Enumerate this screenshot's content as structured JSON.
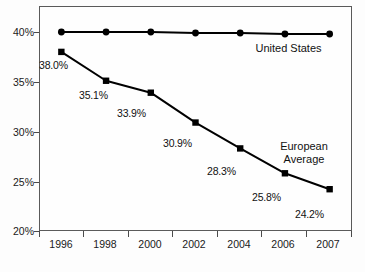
{
  "chart_data": {
    "type": "line",
    "title": "",
    "subtitle": "",
    "xlabel": "",
    "ylabel": "",
    "categories": [
      "1996",
      "1998",
      "2000",
      "2002",
      "2004",
      "2006",
      "2007"
    ],
    "ylim": [
      20,
      40
    ],
    "ytick_labels": [
      "20%",
      "25%",
      "30%",
      "35%",
      "40%"
    ],
    "ytick_values": [
      20,
      25,
      30,
      35,
      40
    ],
    "grid": false,
    "legend_position": "inline-annotation",
    "series": [
      {
        "name": "United States",
        "marker": "circle",
        "color": "#000000",
        "values": [
          40.0,
          40.0,
          40.0,
          39.9,
          39.9,
          39.8,
          39.8
        ],
        "data_labels": []
      },
      {
        "name": "European Average",
        "marker": "square",
        "color": "#000000",
        "values": [
          38.0,
          35.1,
          33.9,
          30.9,
          28.3,
          25.8,
          24.2
        ],
        "data_labels": [
          "38.0%",
          "35.1%",
          "33.9%",
          "30.9%",
          "28.3%",
          "25.8%",
          "24.2%"
        ]
      }
    ],
    "annotations": [
      {
        "text": "United States",
        "series": "United States"
      },
      {
        "text_line1": "European",
        "text_line2": "Average",
        "series": "European Average"
      }
    ]
  },
  "axis": {
    "y_labels": [
      "40%",
      "35%",
      "30%",
      "25%",
      "20%"
    ],
    "x_labels": [
      "1996",
      "1998",
      "2000",
      "2002",
      "2004",
      "2006",
      "2007"
    ]
  },
  "labels": {
    "us_annotation": "United States",
    "eu_annotation_line1": "European",
    "eu_annotation_line2": "Average",
    "eu_values": [
      "38.0%",
      "35.1%",
      "33.9%",
      "30.9%",
      "28.3%",
      "25.8%",
      "24.2%"
    ]
  },
  "colors": {
    "line": "#000000",
    "frame": "#5a5a5a",
    "background": "#fdfdfd",
    "text": "#111111"
  }
}
